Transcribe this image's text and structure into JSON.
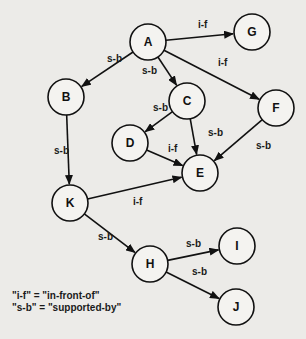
{
  "diagram": {
    "nodes": [
      {
        "id": "A",
        "label": "A",
        "x": 148,
        "y": 42
      },
      {
        "id": "G",
        "label": "G",
        "x": 252,
        "y": 32
      },
      {
        "id": "B",
        "label": "B",
        "x": 66,
        "y": 97
      },
      {
        "id": "C",
        "label": "C",
        "x": 187,
        "y": 101
      },
      {
        "id": "F",
        "label": "F",
        "x": 276,
        "y": 108
      },
      {
        "id": "D",
        "label": "D",
        "x": 130,
        "y": 143
      },
      {
        "id": "E",
        "label": "E",
        "x": 200,
        "y": 173
      },
      {
        "id": "K",
        "label": "K",
        "x": 70,
        "y": 203
      },
      {
        "id": "H",
        "label": "H",
        "x": 150,
        "y": 264
      },
      {
        "id": "I",
        "label": "I",
        "x": 237,
        "y": 246
      },
      {
        "id": "J",
        "label": "J",
        "x": 236,
        "y": 307
      }
    ],
    "edges": [
      {
        "from": "A",
        "to": "G",
        "label": "i-f",
        "lx": 198,
        "ly": 28
      },
      {
        "from": "A",
        "to": "B",
        "label": "s-b",
        "lx": 107,
        "ly": 62
      },
      {
        "from": "A",
        "to": "C",
        "label": "s-b",
        "lx": 142,
        "ly": 74
      },
      {
        "from": "A",
        "to": "F",
        "label": "i-f",
        "lx": 218,
        "ly": 66
      },
      {
        "from": "C",
        "to": "D",
        "label": "s-b",
        "lx": 153,
        "ly": 111
      },
      {
        "from": "C",
        "to": "E",
        "label": "s-b",
        "lx": 208,
        "ly": 136
      },
      {
        "from": "F",
        "to": "E",
        "label": "s-b",
        "lx": 256,
        "ly": 149
      },
      {
        "from": "D",
        "to": "E",
        "label": "i-f",
        "lx": 168,
        "ly": 152
      },
      {
        "from": "B",
        "to": "K",
        "label": "s-b",
        "lx": 54,
        "ly": 154
      },
      {
        "from": "K",
        "to": "E",
        "label": "i-f",
        "lx": 133,
        "ly": 205
      },
      {
        "from": "K",
        "to": "H",
        "label": "s-b",
        "lx": 98,
        "ly": 240
      },
      {
        "from": "H",
        "to": "I",
        "label": "s-b",
        "lx": 186,
        "ly": 247
      },
      {
        "from": "H",
        "to": "J",
        "label": "s-b",
        "lx": 192,
        "ly": 275
      }
    ],
    "legend": [
      "\"i-f\" = \"in-front-of\"",
      "\"s-b\" = \"supported-by\""
    ]
  }
}
